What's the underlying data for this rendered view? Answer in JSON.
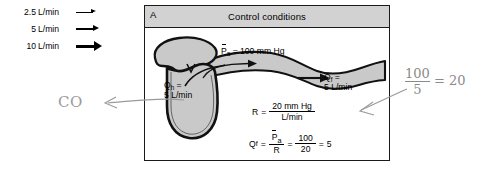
{
  "legend": {
    "rows": [
      {
        "value": "2.5",
        "unit": "L/min",
        "arrow": "thin-arrow-icon"
      },
      {
        "value": "5",
        "unit": "L/min",
        "arrow": "medium-arrow-icon"
      },
      {
        "value": "10",
        "unit": "L/min",
        "arrow": "thick-arrow-icon"
      }
    ]
  },
  "panel": {
    "letter": "A",
    "title": "Control conditions",
    "arterial_pressure": {
      "symbol": "P",
      "subscript": "a",
      "equals": "= 100 mm Hg"
    },
    "flow_out": {
      "symbol": "Q",
      "subscript": "f",
      "equals": "=",
      "value": "5 L/min"
    },
    "heart_flow": {
      "symbol": "Q",
      "subscript": "h",
      "equals": "=",
      "value": "5 L/min"
    },
    "resistance_equation": {
      "lhs": "R",
      "equals": "=",
      "numerator": "20 mm Hg",
      "denominator": "L/min"
    },
    "flow_equation": {
      "lhs_symbol": "Q",
      "lhs_subscript": "f",
      "equals1": "=",
      "frac1_num_symbol": "P",
      "frac1_num_subscript": "a",
      "frac1_den": "R",
      "equals2": "=",
      "frac2_num": "100",
      "frac2_den": "20",
      "equals3": "=",
      "result": "5"
    }
  },
  "annotations": {
    "co_label": "CO",
    "calc_numerator": "100",
    "calc_denominator": "5",
    "calc_equals": "= 20"
  },
  "colors": {
    "panel_border": "#1a1a1a",
    "header_fill": "#d2d2d2",
    "vessel_fill": "#c9c9c9",
    "vessel_wall": "#111111",
    "pencil": "#8d8d8d",
    "page_bg": "#ffffff"
  }
}
